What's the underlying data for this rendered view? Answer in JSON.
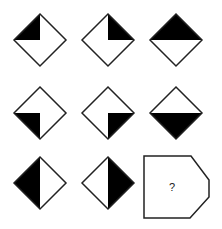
{
  "puzzle": {
    "type": "3x3 figure matrix",
    "colors": {
      "fill": "#000000",
      "stroke": "#222222",
      "background": "#ffffff"
    },
    "cells": [
      {
        "row": 1,
        "col": 1,
        "shape": "diamond",
        "shaded": "top-left quarter",
        "cx": 40,
        "cy": 40
      },
      {
        "row": 1,
        "col": 2,
        "shape": "diamond",
        "shaded": "top-right quarter",
        "cx": 108,
        "cy": 40
      },
      {
        "row": 1,
        "col": 3,
        "shape": "diamond",
        "shaded": "top half",
        "cx": 176,
        "cy": 40
      },
      {
        "row": 2,
        "col": 1,
        "shape": "diamond",
        "shaded": "bottom-left quarter",
        "cx": 40,
        "cy": 113
      },
      {
        "row": 2,
        "col": 2,
        "shape": "diamond",
        "shaded": "bottom-right quarter",
        "cx": 108,
        "cy": 113
      },
      {
        "row": 2,
        "col": 3,
        "shape": "diamond",
        "shaded": "bottom half",
        "cx": 176,
        "cy": 113
      },
      {
        "row": 3,
        "col": 1,
        "shape": "diamond",
        "shaded": "left half",
        "cx": 40,
        "cy": 183
      },
      {
        "row": 3,
        "col": 2,
        "shape": "diamond",
        "shaded": "right half",
        "cx": 108,
        "cy": 183
      }
    ],
    "answer_box": {
      "label": "?"
    }
  }
}
